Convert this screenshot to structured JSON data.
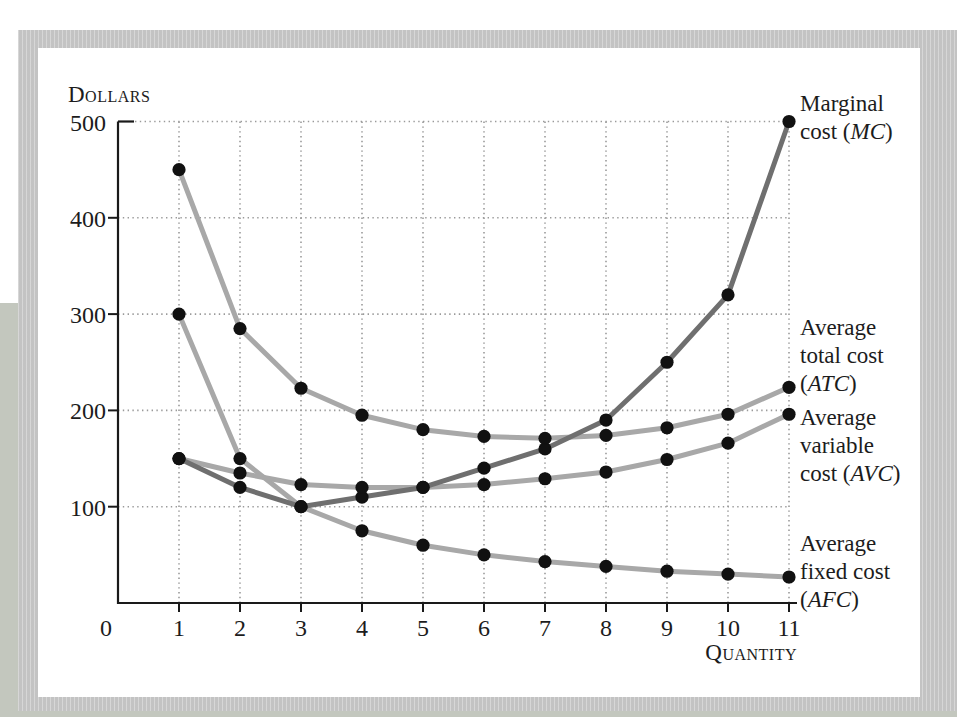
{
  "figure": {
    "y_axis_title": "Dollars",
    "x_axis_title": "Quantity"
  },
  "curve_labels": {
    "mc": {
      "line1": "Marginal",
      "line2_pre": "cost (",
      "abbr": "MC",
      "line2_post": ")"
    },
    "atc": {
      "line1": "Average",
      "line2": "total cost",
      "line3_pre": "(",
      "abbr": "ATC",
      "line3_post": ")"
    },
    "avc": {
      "line1": "Average",
      "line2": "variable",
      "line3_pre": "cost (",
      "abbr": "AVC",
      "line3_post": ")"
    },
    "afc": {
      "line1": "Average",
      "line2": "fixed cost",
      "line3_pre": "(",
      "abbr": "AFC",
      "line3_post": ")"
    }
  },
  "colors": {
    "mc_curve": "#6f6f6f",
    "avg_curves": "#a8a8a8",
    "dot": "#111111",
    "axis": "#1a1a1a",
    "grid": "#9a9a9a",
    "frame": "#c7c7c7",
    "page_shadow": "#c3c7be",
    "text": "#1c1c1c"
  },
  "chart_data": {
    "type": "line",
    "xlabel": "Quantity",
    "ylabel": "Dollars",
    "x": [
      1,
      2,
      3,
      4,
      5,
      6,
      7,
      8,
      9,
      10,
      11
    ],
    "xticks": [
      0,
      1,
      2,
      3,
      4,
      5,
      6,
      7,
      8,
      9,
      10,
      11
    ],
    "yticks": [
      100,
      200,
      300,
      400,
      500
    ],
    "xlim": [
      0,
      11
    ],
    "ylim": [
      0,
      500
    ],
    "grid": "dotted-both-axes",
    "legend_position": "labels-right-of-curves",
    "marker": "filled-black-circle",
    "series": [
      {
        "name": "Marginal cost (MC)",
        "abbr": "MC",
        "color": "#6f6f6f",
        "values": [
          150,
          120,
          100,
          110,
          120,
          140,
          160,
          190,
          250,
          320,
          500
        ]
      },
      {
        "name": "Average total cost (ATC)",
        "abbr": "ATC",
        "color": "#a8a8a8",
        "values": [
          450,
          285,
          223,
          195,
          180,
          173,
          171,
          174,
          182,
          196,
          224
        ]
      },
      {
        "name": "Average variable cost (AVC)",
        "abbr": "AVC",
        "color": "#a8a8a8",
        "values": [
          150,
          135,
          123,
          120,
          120,
          123,
          129,
          136,
          149,
          166,
          196
        ]
      },
      {
        "name": "Average fixed cost (AFC)",
        "abbr": "AFC",
        "color": "#a8a8a8",
        "values": [
          300,
          150,
          100,
          75,
          60,
          50,
          43,
          38,
          33,
          30,
          27
        ]
      }
    ]
  }
}
